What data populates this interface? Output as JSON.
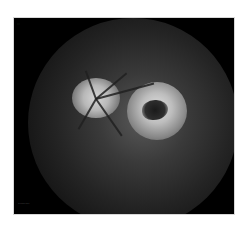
{
  "image": {
    "type": "fundus-photograph",
    "description": "Red-free/grayscale retinal fundus image showing optic disc and an adjacent bright lesion with dark central area",
    "colors": {
      "background": "#ffffff",
      "frame": "#000000",
      "highlight": "#d6d6d6"
    }
  },
  "overlay": {
    "top_left_label": "···",
    "bottom_left_label": "·········"
  }
}
